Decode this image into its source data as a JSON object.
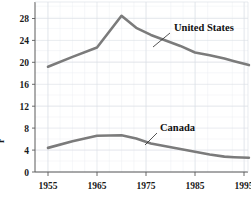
{
  "chart_data": {
    "type": "line",
    "title": "",
    "subtitle": "",
    "xlabel": "",
    "ylabel": "r",
    "xlim": [
      1953,
      1998
    ],
    "ylim": [
      0,
      30
    ],
    "xticks": [
      1955,
      1965,
      1975,
      1985,
      1995
    ],
    "yticks": [
      0,
      4,
      8,
      12,
      16,
      20,
      24,
      28
    ],
    "grid": true,
    "legend_position": "inline-annotations",
    "series": [
      {
        "name": "United States",
        "color": "#7b7b7b",
        "x": [
          1955,
          1960,
          1965,
          1970,
          1973,
          1976,
          1979,
          1982,
          1985,
          1988,
          1991,
          1993,
          1996
        ],
        "values": [
          19.2,
          21.0,
          22.7,
          28.5,
          26.3,
          25.0,
          24.0,
          23.0,
          21.8,
          21.3,
          20.7,
          20.2,
          19.5
        ]
      },
      {
        "name": "Canada",
        "color": "#7b7b7b",
        "x": [
          1955,
          1960,
          1965,
          1970,
          1973,
          1976,
          1979,
          1982,
          1985,
          1988,
          1991,
          1993,
          1996
        ],
        "values": [
          4.4,
          5.6,
          6.6,
          6.7,
          6.1,
          5.2,
          4.7,
          4.2,
          3.7,
          3.2,
          2.8,
          2.7,
          2.6
        ]
      }
    ],
    "annotations": [
      {
        "label": "United States",
        "x_px": 172,
        "y_px": 31
      },
      {
        "label": "Canada",
        "x_px": 158,
        "y_px": 131
      }
    ]
  },
  "axis": {
    "y_title": "r",
    "y_tick_labels": [
      "28",
      "24",
      "20",
      "16",
      "12",
      "8",
      "4",
      "0"
    ],
    "x_tick_labels": [
      "1955",
      "1965",
      "1975",
      "1985",
      "1995"
    ]
  },
  "labels": {
    "united_states": "United States",
    "canada": "Canada"
  }
}
